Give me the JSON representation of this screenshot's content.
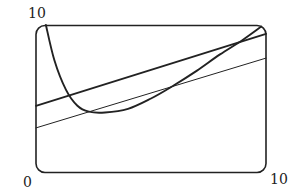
{
  "chart_data": {
    "type": "line",
    "title": "",
    "xlabel": "",
    "ylabel": "",
    "xlim": [
      0,
      10
    ],
    "ylim": [
      0,
      10
    ],
    "grid": false,
    "legend": null,
    "tick_labels": {
      "y_max": "10",
      "origin": "0",
      "x_max": "10"
    },
    "series": [
      {
        "name": "curve",
        "style": "thick",
        "x": [
          0.43,
          0.8,
          1.3,
          1.8,
          2.3,
          3.0,
          4.0,
          5.0,
          6.0,
          7.0,
          8.0,
          9.0,
          9.8
        ],
        "y": [
          10.0,
          7.6,
          5.6,
          4.5,
          4.1,
          4.05,
          4.3,
          5.0,
          5.9,
          6.9,
          8.0,
          9.0,
          9.9
        ]
      },
      {
        "name": "thick line",
        "style": "thick",
        "x": [
          0,
          10
        ],
        "y": [
          4.5,
          9.4
        ]
      },
      {
        "name": "thin line",
        "style": "thin",
        "x": [
          0,
          10
        ],
        "y": [
          3.0,
          7.75
        ]
      }
    ]
  },
  "colors": {
    "ink": "#222222",
    "background": "#ffffff"
  }
}
